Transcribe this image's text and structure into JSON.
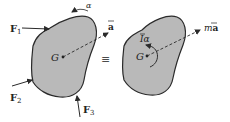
{
  "diagram": {
    "type": "rigid-body free-body diagram equivalence",
    "colors": {
      "body_fill": "#b9b9b9",
      "outline": "#2a2a2a",
      "ink": "#222222"
    },
    "left_body": {
      "center_label": "G",
      "forces": [
        {
          "label": "F",
          "sub": "1"
        },
        {
          "label": "F",
          "sub": "2"
        },
        {
          "label": "F",
          "sub": "3"
        }
      ],
      "angular_accel_label": "α",
      "accel_label": "a"
    },
    "equivalence_symbol": "≡",
    "right_body": {
      "center_label": "G",
      "moment_label_I": "I",
      "moment_label_alpha": "α",
      "force_label_m": "m",
      "force_label_a": "a"
    }
  }
}
